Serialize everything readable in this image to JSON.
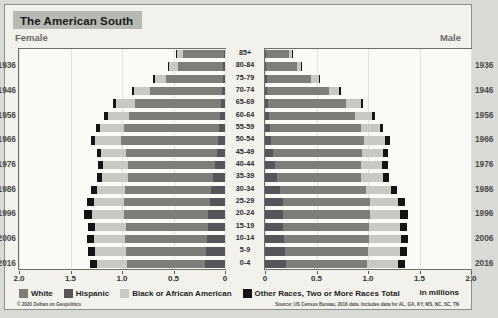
{
  "header": {
    "title": "The American South"
  },
  "axis_labels": {
    "female": "Female",
    "male": "Male",
    "units": "in millions"
  },
  "footer": {
    "copyright": "© 2020 Zeihan on Geopolitics",
    "source": "Source: US Census Bureau, 2016 data. Includes data for AL, GA, KY, MS, NC, SC, TN"
  },
  "legend": {
    "position": "bottom-left",
    "items": [
      {
        "label": "White",
        "color": "#7d7d79"
      },
      {
        "label": "Hispanic",
        "color": "#56565a"
      },
      {
        "label": "Black or African American",
        "color": "#c9c8c2"
      },
      {
        "label": "Other Races, Two or More Races Total",
        "color": "#141414"
      }
    ]
  },
  "chart_data": {
    "type": "bar",
    "subtype": "population-pyramid",
    "title": "The American South",
    "xlabel": "in millions",
    "ylabel": "",
    "xlim": [
      0,
      2.0
    ],
    "grid": true,
    "tick_values": [
      2.0,
      1.5,
      1.0,
      0.5,
      0
    ],
    "tick_labels_female": [
      "2.0",
      "1.5",
      "1.0",
      "0.5",
      "0"
    ],
    "tick_labels_male": [
      "0",
      "0.5",
      "1.0",
      "1.5",
      "2.0"
    ],
    "categories": [
      "85+",
      "80-84",
      "75-79",
      "70-74",
      "65-69",
      "60-64",
      "55-59",
      "50-54",
      "45-49",
      "40-44",
      "35-39",
      "30-34",
      "25-29",
      "20-24",
      "15-19",
      "10-14",
      "5-9",
      "0-4"
    ],
    "birth_year_labels": [
      "1936",
      "1946",
      "1956",
      "1966",
      "1976",
      "1986",
      "1996",
      "2006",
      "2016"
    ],
    "birth_year_rows": [
      1,
      3,
      5,
      7,
      9,
      11,
      13,
      15,
      17
    ],
    "stack_order_outward": [
      "Other Races, Two or More Races Total",
      "Black or African American",
      "White",
      "Hispanic"
    ],
    "series": [
      {
        "name": "White",
        "side": "female",
        "values": [
          0.4,
          0.44,
          0.55,
          0.7,
          0.83,
          0.88,
          0.92,
          0.94,
          0.88,
          0.84,
          0.82,
          0.83,
          0.83,
          0.82,
          0.8,
          0.8,
          0.78,
          0.76
        ]
      },
      {
        "name": "Black or African American",
        "side": "female",
        "values": [
          0.06,
          0.08,
          0.11,
          0.15,
          0.19,
          0.21,
          0.23,
          0.25,
          0.24,
          0.24,
          0.25,
          0.27,
          0.29,
          0.31,
          0.3,
          0.3,
          0.3,
          0.29
        ]
      },
      {
        "name": "Hispanic",
        "side": "female",
        "values": [
          0.01,
          0.02,
          0.02,
          0.03,
          0.04,
          0.05,
          0.06,
          0.07,
          0.08,
          0.1,
          0.12,
          0.14,
          0.15,
          0.16,
          0.16,
          0.17,
          0.18,
          0.19
        ]
      },
      {
        "name": "Other Races, Two or More Races Total",
        "side": "female",
        "values": [
          0.01,
          0.01,
          0.02,
          0.02,
          0.03,
          0.03,
          0.04,
          0.04,
          0.04,
          0.05,
          0.05,
          0.06,
          0.07,
          0.08,
          0.07,
          0.07,
          0.07,
          0.07
        ]
      },
      {
        "name": "White",
        "side": "male",
        "values": [
          0.22,
          0.3,
          0.43,
          0.6,
          0.76,
          0.83,
          0.88,
          0.9,
          0.86,
          0.83,
          0.81,
          0.83,
          0.85,
          0.85,
          0.84,
          0.83,
          0.81,
          0.79
        ]
      },
      {
        "name": "Black or African American",
        "side": "male",
        "values": [
          0.03,
          0.04,
          0.07,
          0.1,
          0.14,
          0.17,
          0.19,
          0.21,
          0.21,
          0.21,
          0.22,
          0.24,
          0.27,
          0.29,
          0.3,
          0.31,
          0.31,
          0.3
        ]
      },
      {
        "name": "Hispanic",
        "side": "male",
        "values": [
          0.01,
          0.01,
          0.02,
          0.02,
          0.03,
          0.04,
          0.05,
          0.06,
          0.08,
          0.1,
          0.12,
          0.15,
          0.17,
          0.17,
          0.17,
          0.18,
          0.19,
          0.2
        ]
      },
      {
        "name": "Other Races, Two or More Races Total",
        "side": "male",
        "values": [
          0.01,
          0.01,
          0.01,
          0.02,
          0.02,
          0.03,
          0.03,
          0.04,
          0.04,
          0.05,
          0.05,
          0.06,
          0.07,
          0.08,
          0.07,
          0.07,
          0.07,
          0.07
        ]
      }
    ]
  }
}
